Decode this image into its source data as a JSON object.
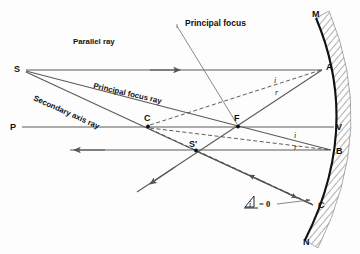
{
  "diagram": {
    "annotations": {
      "principal_focus": "Principal focus",
      "parallel_ray": "Parallel ray",
      "principal_focus_ray": "Principal focus ray",
      "secondary_axis_ray": "Secondary axis ray",
      "angle_zero": "= 0",
      "angle_symbol": "i"
    },
    "points": [
      {
        "id": "S",
        "label": "S",
        "x": 18,
        "y": 69,
        "desc": "object-point"
      },
      {
        "id": "P",
        "label": "P",
        "x": 14,
        "y": 127,
        "desc": "principal-axis-left"
      },
      {
        "id": "C",
        "label": "C",
        "x": 148,
        "y": 126,
        "desc": "centre-of-curvature"
      },
      {
        "id": "F",
        "label": "F",
        "x": 238,
        "y": 126,
        "desc": "principal-focus"
      },
      {
        "id": "Sp",
        "label": "S'",
        "x": 196,
        "y": 150,
        "desc": "image-point"
      },
      {
        "id": "M",
        "label": "M",
        "x": 316,
        "y": 18,
        "desc": "mirror-top"
      },
      {
        "id": "A",
        "label": "A",
        "x": 322,
        "y": 70,
        "desc": "mirror-point-a"
      },
      {
        "id": "V",
        "label": "V",
        "x": 332,
        "y": 127,
        "desc": "mirror-vertex"
      },
      {
        "id": "B",
        "label": "B",
        "x": 332,
        "y": 150,
        "desc": "mirror-point-b"
      },
      {
        "id": "Cm",
        "label": "C",
        "x": 316,
        "y": 205,
        "desc": "mirror-point-c"
      },
      {
        "id": "N",
        "label": "N",
        "x": 305,
        "y": 240,
        "desc": "mirror-bottom"
      }
    ],
    "angle_labels": [
      {
        "id": "i-at-A",
        "text": "i",
        "x": 276,
        "y": 80
      },
      {
        "id": "r-at-A",
        "text": "r",
        "x": 277,
        "y": 92
      },
      {
        "id": "i-at-B",
        "text": "i",
        "x": 296,
        "y": 135
      },
      {
        "id": "r-at-B",
        "text": "r",
        "x": 296,
        "y": 147
      }
    ],
    "colors": {
      "ray": "#5a5a5a",
      "mirror": "#111111",
      "hatch": "#707070",
      "background": "#ffffff"
    }
  }
}
